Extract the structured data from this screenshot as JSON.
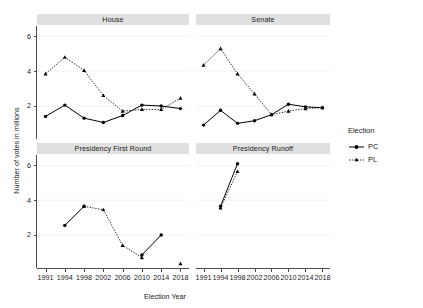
{
  "chart_data": {
    "type": "line",
    "title": "",
    "xlabel": "Election Year",
    "ylabel": "Number of votes in millions",
    "x": [
      1991,
      1994,
      1998,
      2002,
      2006,
      2010,
      2014,
      2018
    ],
    "xtick_labels": [
      "1991",
      "1994",
      "1998",
      "2002",
      "2006",
      "2010",
      "2014",
      "2018"
    ],
    "ytick_labels": [
      "2",
      "4",
      "6"
    ],
    "yticks": [
      2,
      4,
      6
    ],
    "ylim": [
      0.1,
      6.6
    ],
    "grid": true,
    "legend": {
      "title": "Election",
      "position": "right",
      "entries": [
        {
          "name": "PC",
          "linestyle": "solid",
          "marker": "circle",
          "color": "#000000"
        },
        {
          "name": "PL",
          "linestyle": "dotted",
          "marker": "triangle",
          "color": "#000000"
        }
      ]
    },
    "facets": [
      {
        "label": "House",
        "series": [
          {
            "name": "PC",
            "x": [
              1991,
              1994,
              1998,
              2002,
              2006,
              2010,
              2014,
              2018
            ],
            "values": [
              1.4,
              2.05,
              1.3,
              1.05,
              1.45,
              2.05,
              2.0,
              1.85
            ]
          },
          {
            "name": "PL",
            "x": [
              1991,
              1994,
              1998,
              2002,
              2006,
              2010,
              2014,
              2018
            ],
            "values": [
              3.85,
              4.8,
              4.05,
              2.6,
              1.7,
              1.8,
              1.8,
              2.45
            ]
          }
        ]
      },
      {
        "label": "Senate",
        "series": [
          {
            "name": "PC",
            "x": [
              1991,
              1994,
              1998,
              2002,
              2006,
              2010,
              2014,
              2018
            ],
            "values": [
              0.9,
              1.75,
              1.0,
              1.15,
              1.5,
              2.1,
              1.95,
              1.9
            ]
          },
          {
            "name": "PL",
            "x": [
              1991,
              1994,
              1998,
              2002,
              2006,
              2010,
              2014,
              2018
            ],
            "values": [
              4.35,
              5.3,
              3.85,
              2.7,
              1.5,
              1.7,
              1.85,
              1.9
            ]
          }
        ]
      },
      {
        "label": "Presidency First Round",
        "series": [
          {
            "name": "PC",
            "x": [
              1994,
              1998,
              2010,
              2014
            ],
            "values": [
              2.55,
              3.65,
              0.85,
              2.0
            ],
            "segments": [
              [
                1994,
                1998
              ],
              [
                2010,
                2014
              ]
            ]
          },
          {
            "name": "PL",
            "x": [
              1998,
              2002,
              2006,
              2010,
              2018
            ],
            "values": [
              3.65,
              3.45,
              1.4,
              0.7,
              0.35
            ],
            "segments": [
              [
                1998,
                2002,
                2006,
                2010
              ]
            ]
          }
        ]
      },
      {
        "label": "Presidency Runoff",
        "series": [
          {
            "name": "PC",
            "x": [
              1994,
              1998
            ],
            "values": [
              3.65,
              6.1
            ]
          },
          {
            "name": "PL",
            "x": [
              1994,
              1998
            ],
            "values": [
              3.55,
              5.65
            ]
          }
        ]
      }
    ]
  }
}
